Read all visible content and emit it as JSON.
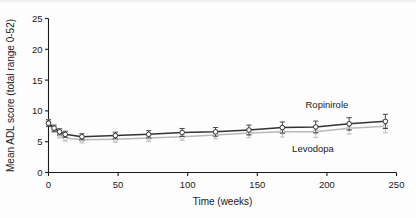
{
  "chart_data": {
    "type": "line",
    "title": "",
    "xlabel": "Time (weeks)",
    "ylabel": "Mean ADL score (total range 0-52)",
    "xlim": [
      0,
      250
    ],
    "ylim": [
      0,
      25
    ],
    "xticks": [
      0,
      50,
      100,
      150,
      200,
      250
    ],
    "yticks": [
      0,
      5,
      10,
      15,
      20,
      25
    ],
    "grid": false,
    "legend_position": "inline-annotation",
    "error_bars": "vertical",
    "series": [
      {
        "name": "Ropinirole",
        "color": "#333333",
        "marker": "open-circle",
        "x": [
          0,
          4,
          8,
          12,
          24,
          48,
          72,
          96,
          120,
          144,
          168,
          192,
          216,
          242
        ],
        "values": [
          8.0,
          7.2,
          6.6,
          6.2,
          5.8,
          6.0,
          6.2,
          6.5,
          6.6,
          6.9,
          7.3,
          7.4,
          7.9,
          8.3
        ],
        "errors": [
          0.55,
          0.5,
          0.5,
          0.5,
          0.5,
          0.55,
          0.6,
          0.65,
          0.7,
          0.8,
          0.9,
          0.95,
          1.0,
          1.15
        ]
      },
      {
        "name": "Levodopa",
        "color": "#b9b9b9",
        "marker": "open-circle",
        "x": [
          0,
          4,
          8,
          12,
          24,
          48,
          72,
          96,
          120,
          144,
          168,
          192,
          216,
          242
        ],
        "values": [
          8.1,
          7.0,
          6.1,
          5.6,
          5.3,
          5.4,
          5.6,
          5.8,
          6.1,
          6.4,
          6.6,
          6.6,
          7.2,
          7.5
        ],
        "errors": [
          0.5,
          0.5,
          0.5,
          0.5,
          0.5,
          0.5,
          0.55,
          0.6,
          0.65,
          0.75,
          0.85,
          0.9,
          0.95,
          1.05
        ]
      }
    ],
    "annotations": [
      {
        "text": "Ropinirole",
        "x": 200,
        "y": 10.4
      },
      {
        "text": "Levodopa",
        "x": 190,
        "y": 3.3
      }
    ]
  }
}
